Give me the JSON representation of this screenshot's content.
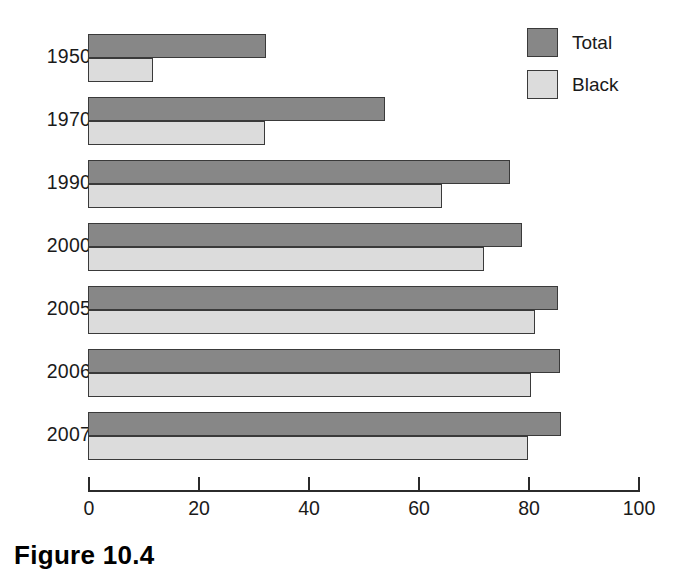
{
  "caption": "Figure 10.4",
  "legend": {
    "position": "top-right",
    "items": [
      {
        "label": "Total",
        "color": "#878787",
        "key": "total"
      },
      {
        "label": "Black",
        "color": "#dcdcdc",
        "key": "black"
      }
    ]
  },
  "axis": {
    "tick_labels": [
      "0",
      "20",
      "40",
      "60",
      "80",
      "100"
    ],
    "tick_values": [
      0,
      20,
      40,
      60,
      80,
      100
    ]
  },
  "chart_data": {
    "type": "bar",
    "orientation": "horizontal",
    "title": "",
    "subtitle": "",
    "xlabel": "",
    "ylabel": "",
    "xlim": [
      0,
      100
    ],
    "xticks": [
      0,
      20,
      40,
      60,
      80,
      100
    ],
    "grid": false,
    "legend_position": "top-right",
    "categories": [
      "1950",
      "1970",
      "1990",
      "2000",
      "2005",
      "2006",
      "2007"
    ],
    "series": [
      {
        "name": "Total",
        "color": "#878787",
        "values": [
          32.4,
          54.0,
          76.7,
          78.9,
          85.4,
          85.8,
          86.0
        ]
      },
      {
        "name": "Black",
        "color": "#dcdcdc",
        "values": [
          11.8,
          32.2,
          64.4,
          72.0,
          81.3,
          80.5,
          80.0
        ]
      }
    ]
  }
}
